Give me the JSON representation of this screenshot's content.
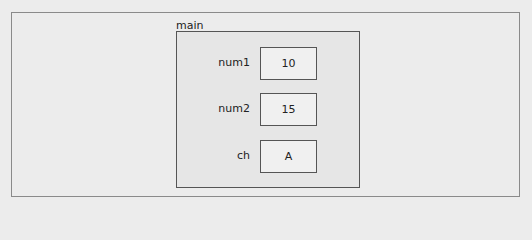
{
  "frame": {
    "name": "main",
    "variables": [
      {
        "name": "num1",
        "value": "10"
      },
      {
        "name": "num2",
        "value": "15"
      },
      {
        "name": "ch",
        "value": "A"
      }
    ]
  }
}
